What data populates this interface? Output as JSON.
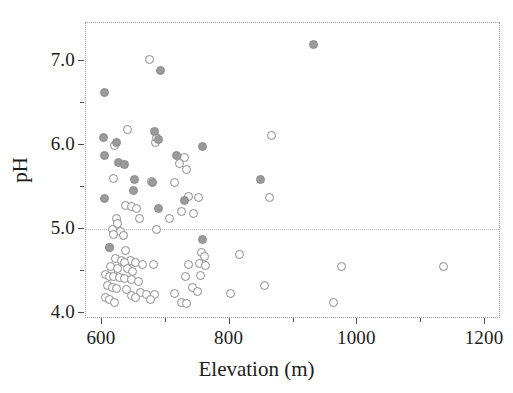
{
  "chart_data": {
    "type": "scatter",
    "title": "",
    "xlabel": "Elevation (m)",
    "ylabel": "pH",
    "xlim": [
      575,
      1225
    ],
    "ylim": [
      3.93,
      7.45
    ],
    "xticks": [
      600,
      800,
      1000,
      1200
    ],
    "xtick_labels": [
      "600",
      "800",
      "1000",
      "1200"
    ],
    "xticks_minor": [
      700,
      900,
      1100
    ],
    "yticks": [
      4.0,
      5.0,
      6.0,
      7.0
    ],
    "ytick_labels": [
      "4.0",
      "5.0",
      "6.0",
      "7.0"
    ],
    "yticks_minor": [
      4.5,
      5.5,
      6.5
    ],
    "grid": false,
    "legend": null,
    "annotations": [
      {
        "type": "hline",
        "y": 5.0,
        "style": "dotted",
        "color": "#b4b4b4"
      }
    ],
    "marker_colors": {
      "open": "#ffffff",
      "open_edge": "#8a8a8a",
      "filled": "#9a9a9a"
    },
    "series": [
      {
        "name": "open",
        "marker": "open-circle",
        "points": [
          [
            674,
            7.02
          ],
          [
            640,
            6.18
          ],
          [
            620,
            5.99
          ],
          [
            684,
            6.03
          ],
          [
            686,
            6.09
          ],
          [
            865,
            6.11
          ],
          [
            729,
            5.85
          ],
          [
            722,
            5.78
          ],
          [
            733,
            5.71
          ],
          [
            618,
            5.6
          ],
          [
            677,
            5.57
          ],
          [
            713,
            5.55
          ],
          [
            735,
            5.39
          ],
          [
            751,
            5.37
          ],
          [
            862,
            5.37
          ],
          [
            637,
            5.28
          ],
          [
            646,
            5.27
          ],
          [
            654,
            5.24
          ],
          [
            724,
            5.21
          ],
          [
            744,
            5.19
          ],
          [
            659,
            5.13
          ],
          [
            705,
            5.13
          ],
          [
            623,
            5.12
          ],
          [
            624,
            5.07
          ],
          [
            686,
            5.0
          ],
          [
            617,
            4.99
          ],
          [
            629,
            4.97
          ],
          [
            618,
            4.93
          ],
          [
            634,
            4.92
          ],
          [
            816,
            4.7
          ],
          [
            756,
            4.72
          ],
          [
            612,
            4.78
          ],
          [
            637,
            4.74
          ],
          [
            760,
            4.67
          ],
          [
            645,
            4.63
          ],
          [
            621,
            4.65
          ],
          [
            630,
            4.62
          ],
          [
            636,
            4.6
          ],
          [
            652,
            4.6
          ],
          [
            663,
            4.58
          ],
          [
            680,
            4.58
          ],
          [
            753,
            4.59
          ],
          [
            762,
            4.57
          ],
          [
            736,
            4.58
          ],
          [
            975,
            4.55
          ],
          [
            1135,
            4.55
          ],
          [
            614,
            4.55
          ],
          [
            624,
            4.53
          ],
          [
            640,
            4.53
          ],
          [
            648,
            4.5
          ],
          [
            606,
            4.46
          ],
          [
            612,
            4.44
          ],
          [
            618,
            4.44
          ],
          [
            628,
            4.42
          ],
          [
            635,
            4.41
          ],
          [
            646,
            4.4
          ],
          [
            658,
            4.38
          ],
          [
            754,
            4.45
          ],
          [
            731,
            4.43
          ],
          [
            854,
            4.33
          ],
          [
            608,
            4.33
          ],
          [
            616,
            4.31
          ],
          [
            622,
            4.29
          ],
          [
            638,
            4.28
          ],
          [
            742,
            4.3
          ],
          [
            750,
            4.26
          ],
          [
            661,
            4.24
          ],
          [
            670,
            4.22
          ],
          [
            682,
            4.22
          ],
          [
            714,
            4.23
          ],
          [
            801,
            4.23
          ],
          [
            606,
            4.18
          ],
          [
            612,
            4.16
          ],
          [
            619,
            4.13
          ],
          [
            646,
            4.21
          ],
          [
            652,
            4.18
          ],
          [
            676,
            4.16
          ],
          [
            724,
            4.13
          ],
          [
            733,
            4.11
          ],
          [
            963,
            4.13
          ]
        ]
      },
      {
        "name": "filled",
        "marker": "filled-circle",
        "points": [
          [
            931,
            7.2
          ],
          [
            691,
            6.88
          ],
          [
            604,
            6.62
          ],
          [
            603,
            6.09
          ],
          [
            683,
            6.16
          ],
          [
            688,
            6.06
          ],
          [
            623,
            6.03
          ],
          [
            758,
            5.98
          ],
          [
            604,
            5.87
          ],
          [
            716,
            5.88
          ],
          [
            626,
            5.79
          ],
          [
            635,
            5.77
          ],
          [
            848,
            5.59
          ],
          [
            651,
            5.59
          ],
          [
            679,
            5.55
          ],
          [
            649,
            5.46
          ],
          [
            604,
            5.36
          ],
          [
            729,
            5.34
          ],
          [
            688,
            5.24
          ],
          [
            757,
            4.87
          ],
          [
            612,
            4.78
          ]
        ]
      }
    ]
  }
}
